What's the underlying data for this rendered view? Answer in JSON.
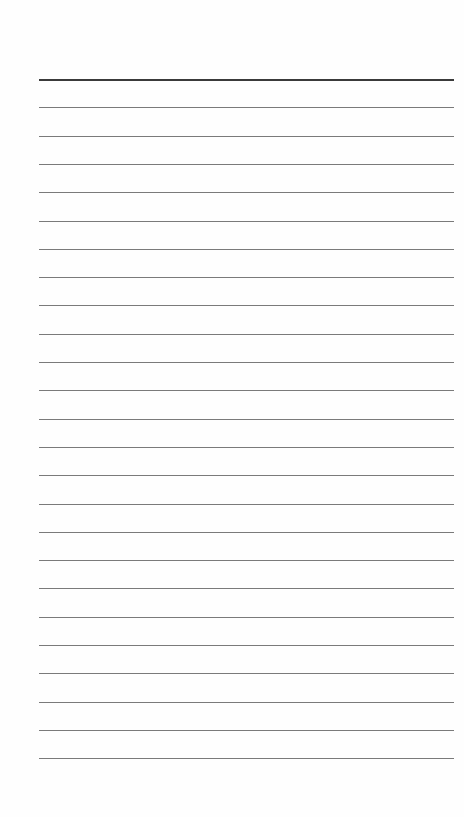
{
  "page": {
    "type": "lined-paper",
    "background": "#fefefe"
  },
  "rules": {
    "count": 25,
    "first_y": 79,
    "spacing": 28.3,
    "left": 39,
    "right": 454,
    "header_color": "#3a3a3a",
    "line_color": "#7a7a7a"
  }
}
